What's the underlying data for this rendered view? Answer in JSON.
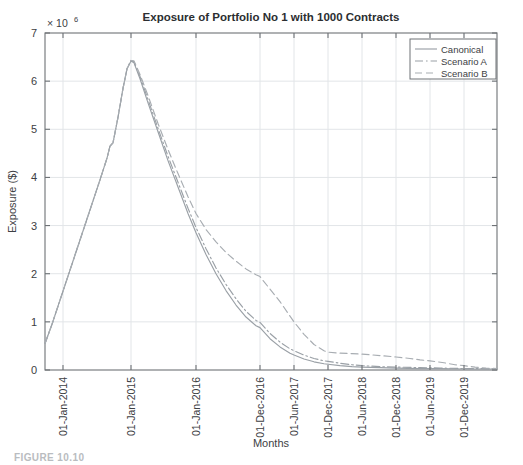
{
  "figure": {
    "caption": "FIGURE 10.10"
  },
  "chart_data": {
    "type": "line",
    "title": "Exposure of Portfolio No 1 with 1000 Contracts",
    "xlabel": "Months",
    "ylabel": "Exposure ($)",
    "y_multiplier_label": "× 10",
    "y_multiplier_exponent": "6",
    "y_multiplier_full": "× 10⁶",
    "ylim": [
      0,
      7000000
    ],
    "yticks": [
      0,
      1,
      2,
      3,
      4,
      5,
      6,
      7
    ],
    "ytick_labels": [
      "0",
      "1",
      "2",
      "3",
      "4",
      "5",
      "6",
      "7"
    ],
    "grid": true,
    "legend_position": "top-right",
    "xtick_labels": [
      "01-Jan-2014",
      "01-Jan-2015",
      "01-Jan-2016",
      "01-Dec-2016",
      "01-Jun-2017",
      "01-Dec-2017",
      "01-Jun-2018",
      "01-Dec-2018",
      "01-Jun-2019",
      "01-Dec-2019"
    ],
    "xtick_positions": [
      63,
      131,
      196,
      260,
      294,
      328,
      362,
      396,
      430,
      464
    ],
    "x_axis_start_px": 45,
    "x_axis_end_px": 497,
    "series": [
      {
        "name": "Canonical",
        "style": "solid",
        "color": "#9aa0a6",
        "points_px": [
          [
            45,
            0.55
          ],
          [
            52,
            0.95
          ],
          [
            60,
            1.45
          ],
          [
            68,
            1.95
          ],
          [
            76,
            2.45
          ],
          [
            84,
            2.95
          ],
          [
            92,
            3.45
          ],
          [
            100,
            3.95
          ],
          [
            107,
            4.4
          ],
          [
            110,
            4.65
          ],
          [
            113,
            4.72
          ],
          [
            118,
            5.25
          ],
          [
            123,
            5.85
          ],
          [
            127,
            6.25
          ],
          [
            131,
            6.42
          ],
          [
            134,
            6.38
          ],
          [
            140,
            6.05
          ],
          [
            148,
            5.55
          ],
          [
            158,
            4.95
          ],
          [
            168,
            4.35
          ],
          [
            178,
            3.8
          ],
          [
            188,
            3.25
          ],
          [
            196,
            2.85
          ],
          [
            206,
            2.4
          ],
          [
            216,
            2.0
          ],
          [
            226,
            1.65
          ],
          [
            236,
            1.35
          ],
          [
            246,
            1.1
          ],
          [
            256,
            0.92
          ],
          [
            260,
            0.88
          ],
          [
            270,
            0.65
          ],
          [
            280,
            0.48
          ],
          [
            290,
            0.35
          ],
          [
            294,
            0.31
          ],
          [
            304,
            0.23
          ],
          [
            314,
            0.17
          ],
          [
            324,
            0.13
          ],
          [
            328,
            0.12
          ],
          [
            340,
            0.09
          ],
          [
            352,
            0.07
          ],
          [
            362,
            0.06
          ],
          [
            380,
            0.05
          ],
          [
            396,
            0.04
          ],
          [
            420,
            0.03
          ],
          [
            440,
            0.03
          ],
          [
            464,
            0.02
          ],
          [
            480,
            0.02
          ],
          [
            497,
            0.02
          ]
        ]
      },
      {
        "name": "Scenario A",
        "style": "dashdot",
        "color": "#9aa0a6",
        "points_px": [
          [
            45,
            0.55
          ],
          [
            52,
            0.95
          ],
          [
            60,
            1.45
          ],
          [
            68,
            1.95
          ],
          [
            76,
            2.45
          ],
          [
            84,
            2.95
          ],
          [
            92,
            3.45
          ],
          [
            100,
            3.95
          ],
          [
            107,
            4.4
          ],
          [
            110,
            4.65
          ],
          [
            113,
            4.72
          ],
          [
            118,
            5.25
          ],
          [
            123,
            5.85
          ],
          [
            127,
            6.26
          ],
          [
            131,
            6.43
          ],
          [
            134,
            6.4
          ],
          [
            140,
            6.1
          ],
          [
            148,
            5.62
          ],
          [
            158,
            5.02
          ],
          [
            168,
            4.44
          ],
          [
            178,
            3.9
          ],
          [
            188,
            3.36
          ],
          [
            196,
            2.96
          ],
          [
            206,
            2.52
          ],
          [
            216,
            2.12
          ],
          [
            226,
            1.78
          ],
          [
            236,
            1.48
          ],
          [
            246,
            1.22
          ],
          [
            256,
            1.03
          ],
          [
            260,
            0.99
          ],
          [
            270,
            0.76
          ],
          [
            280,
            0.58
          ],
          [
            290,
            0.44
          ],
          [
            294,
            0.4
          ],
          [
            304,
            0.31
          ],
          [
            314,
            0.24
          ],
          [
            324,
            0.19
          ],
          [
            328,
            0.18
          ],
          [
            340,
            0.14
          ],
          [
            352,
            0.11
          ],
          [
            362,
            0.09
          ],
          [
            380,
            0.07
          ],
          [
            396,
            0.06
          ],
          [
            420,
            0.05
          ],
          [
            440,
            0.04
          ],
          [
            464,
            0.03
          ],
          [
            480,
            0.03
          ],
          [
            497,
            0.02
          ]
        ]
      },
      {
        "name": "Scenario B",
        "style": "dashed",
        "color": "#a8adb2",
        "points_px": [
          [
            45,
            0.55
          ],
          [
            52,
            0.95
          ],
          [
            60,
            1.45
          ],
          [
            68,
            1.95
          ],
          [
            76,
            2.45
          ],
          [
            84,
            2.95
          ],
          [
            92,
            3.45
          ],
          [
            100,
            3.95
          ],
          [
            107,
            4.4
          ],
          [
            110,
            4.65
          ],
          [
            113,
            4.72
          ],
          [
            118,
            5.25
          ],
          [
            123,
            5.85
          ],
          [
            127,
            6.26
          ],
          [
            131,
            6.43
          ],
          [
            134,
            6.42
          ],
          [
            140,
            6.14
          ],
          [
            148,
            5.7
          ],
          [
            158,
            5.12
          ],
          [
            168,
            4.58
          ],
          [
            178,
            4.08
          ],
          [
            188,
            3.6
          ],
          [
            196,
            3.25
          ],
          [
            206,
            2.92
          ],
          [
            216,
            2.66
          ],
          [
            226,
            2.44
          ],
          [
            236,
            2.26
          ],
          [
            246,
            2.1
          ],
          [
            256,
            1.98
          ],
          [
            260,
            1.94
          ],
          [
            270,
            1.68
          ],
          [
            280,
            1.42
          ],
          [
            290,
            1.12
          ],
          [
            294,
            1.0
          ],
          [
            304,
            0.74
          ],
          [
            314,
            0.53
          ],
          [
            324,
            0.4
          ],
          [
            328,
            0.37
          ],
          [
            340,
            0.35
          ],
          [
            352,
            0.34
          ],
          [
            362,
            0.33
          ],
          [
            380,
            0.3
          ],
          [
            396,
            0.27
          ],
          [
            410,
            0.24
          ],
          [
            420,
            0.21
          ],
          [
            430,
            0.19
          ],
          [
            444,
            0.15
          ],
          [
            455,
            0.11
          ],
          [
            464,
            0.09
          ],
          [
            475,
            0.06
          ],
          [
            486,
            0.04
          ],
          [
            497,
            0.03
          ]
        ]
      }
    ]
  }
}
